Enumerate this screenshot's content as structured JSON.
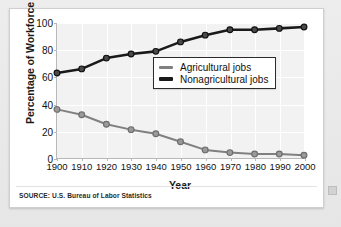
{
  "source_note": "SOURCE: U.S. Bureau of Labor Statistics",
  "colors": {
    "agricultural": "#808080",
    "nonagricultural": "#1a1a1a",
    "plot_background": "#f2f2f2",
    "gridline": "#ffffff",
    "axis": "#b8b8b8",
    "card_background": "#ffffff",
    "page_background": "#eaeaea"
  },
  "chart_data": {
    "type": "line",
    "title": "",
    "xlabel": "Year",
    "ylabel": "Percentage of Workforce",
    "categories": [
      "1900",
      "1910",
      "1920",
      "1930",
      "1940",
      "1950",
      "1960",
      "1970",
      "1980",
      "1990",
      "2000"
    ],
    "x": [
      1900,
      1910,
      1920,
      1930,
      1940,
      1950,
      1960,
      1970,
      1980,
      1990,
      2000
    ],
    "xlim": [
      1900,
      2000
    ],
    "ylim": [
      0,
      100
    ],
    "yticks": [
      0,
      20,
      40,
      60,
      80,
      100
    ],
    "ytick_labels": [
      "0",
      "20",
      "40",
      "60",
      "80",
      "100"
    ],
    "grid": true,
    "legend_position": "center-right",
    "markers": "circle",
    "series": [
      {
        "name": "Agricultural jobs",
        "color": "#808080",
        "values": [
          36,
          32,
          25,
          21,
          18,
          12,
          6,
          4,
          3,
          3,
          2
        ]
      },
      {
        "name": "Nonagricultural jobs",
        "color": "#1a1a1a",
        "values": [
          63,
          66,
          74,
          77,
          79,
          86,
          91,
          95,
          95,
          96,
          97
        ]
      }
    ]
  }
}
